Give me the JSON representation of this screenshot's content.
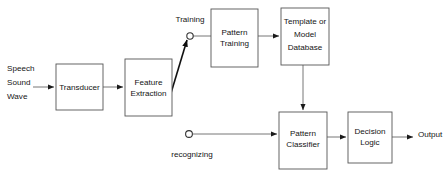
{
  "diagram": {
    "background_color": "#ffffff",
    "box_stroke_color": "#555555",
    "connector_color": "#666666",
    "diagonal_color": "#111111",
    "text_color": "#141414",
    "nodes": [
      {
        "id": "transducer",
        "label_lines": [
          "Transducer"
        ],
        "x": 56,
        "y": 64,
        "w": 47,
        "h": 46
      },
      {
        "id": "feature",
        "label_lines": [
          "Feature",
          "Extraction"
        ],
        "x": 125,
        "y": 59,
        "w": 47,
        "h": 57
      },
      {
        "id": "pattern_training",
        "label_lines": [
          "Pattern",
          "Training"
        ],
        "x": 211,
        "y": 9,
        "w": 47,
        "h": 58
      },
      {
        "id": "database",
        "label_lines": [
          "Template or",
          "Model",
          "Database"
        ],
        "x": 281,
        "y": 8,
        "w": 48,
        "h": 57
      },
      {
        "id": "classifier",
        "label_lines": [
          "Pattern",
          "Classifier"
        ],
        "x": 279,
        "y": 112,
        "w": 48,
        "h": 57
      },
      {
        "id": "decision",
        "label_lines": [
          "Decision",
          "Logic"
        ],
        "x": 348,
        "y": 112,
        "w": 44,
        "h": 51
      }
    ],
    "free_labels": [
      {
        "id": "input-label",
        "lines": [
          "Speech",
          "Sound",
          "Wave"
        ],
        "x": 7,
        "y": 71,
        "align": "start"
      },
      {
        "id": "training-label",
        "lines": [
          "Training"
        ],
        "x": 190,
        "y": 22,
        "align": "center"
      },
      {
        "id": "recognizing-label",
        "lines": [
          "recognizing"
        ],
        "x": 192,
        "y": 157,
        "align": "center"
      },
      {
        "id": "output-label",
        "lines": [
          "Output"
        ],
        "x": 418,
        "y": 137,
        "align": "start"
      }
    ],
    "terminals": [
      {
        "id": "training-terminal",
        "label": "Training",
        "cx": 190,
        "cy": 36,
        "r": 3.2
      },
      {
        "id": "recognizing-terminal",
        "label": "recognizing",
        "cx": 189,
        "cy": 134,
        "r": 3.4
      }
    ],
    "connectors": [
      {
        "id": "input-to-transducer",
        "from": "Speech Sound Wave",
        "to": "Transducer",
        "kind": "arrow-right"
      },
      {
        "id": "transducer-to-feature",
        "from": "Transducer",
        "to": "Feature Extraction",
        "kind": "arrow-right"
      },
      {
        "id": "feature-to-training-switch",
        "from": "Feature Extraction",
        "to": "Training",
        "kind": "diagonal-arrow"
      },
      {
        "id": "training-to-pattern",
        "from": "Training",
        "to": "Pattern Training",
        "kind": "line"
      },
      {
        "id": "pattern-to-database",
        "from": "Pattern Training",
        "to": "Template or Model Database",
        "kind": "arrow-right"
      },
      {
        "id": "database-to-classifier",
        "from": "Template or Model Database",
        "to": "Pattern Classifier",
        "kind": "arrow-down"
      },
      {
        "id": "recognizing-to-classifier",
        "from": "recognizing",
        "to": "Pattern Classifier",
        "kind": "arrow-right"
      },
      {
        "id": "classifier-to-decision",
        "from": "Pattern Classifier",
        "to": "Decision Logic",
        "kind": "arrow-right"
      },
      {
        "id": "decision-to-output",
        "from": "Decision Logic",
        "to": "Output",
        "kind": "arrow-right"
      }
    ]
  }
}
